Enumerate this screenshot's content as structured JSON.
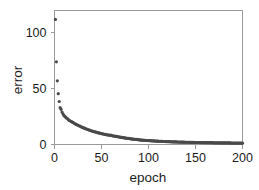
{
  "chart_data": {
    "type": "scatter",
    "title": "",
    "xlabel": "epoch",
    "ylabel": "error",
    "xlim": [
      0,
      200
    ],
    "ylim": [
      0,
      120
    ],
    "xticks": [
      0,
      50,
      100,
      150,
      200
    ],
    "yticks": [
      0,
      50,
      100
    ],
    "xtick_labels": [
      "0",
      "50",
      "100",
      "150",
      "200"
    ],
    "ytick_labels": [
      "0",
      "50",
      "100"
    ],
    "grid": false,
    "legend": null,
    "marker": {
      "shape": "circle",
      "color": "#4a4a4a",
      "size": 1.6
    },
    "frame_color": "#9a9a9a",
    "background": "#ffffff",
    "series": [
      {
        "name": "training error",
        "x": [
          1,
          2,
          3,
          4,
          5,
          6,
          7,
          8,
          9,
          10,
          11,
          12,
          13,
          14,
          15,
          16,
          17,
          18,
          19,
          20,
          21,
          22,
          23,
          24,
          25,
          26,
          27,
          28,
          29,
          30,
          31,
          32,
          33,
          34,
          35,
          36,
          37,
          38,
          39,
          40,
          41,
          42,
          43,
          44,
          45,
          46,
          47,
          48,
          49,
          50,
          51,
          52,
          53,
          54,
          55,
          56,
          57,
          58,
          59,
          60,
          61,
          62,
          63,
          64,
          65,
          66,
          67,
          68,
          69,
          70,
          71,
          72,
          73,
          74,
          75,
          76,
          77,
          78,
          79,
          80,
          81,
          82,
          83,
          84,
          85,
          86,
          87,
          88,
          89,
          90,
          91,
          92,
          93,
          94,
          95,
          96,
          97,
          98,
          99,
          100,
          101,
          102,
          103,
          104,
          105,
          106,
          107,
          108,
          109,
          110,
          111,
          112,
          113,
          114,
          115,
          116,
          117,
          118,
          119,
          120,
          121,
          122,
          123,
          124,
          125,
          126,
          127,
          128,
          129,
          130,
          131,
          132,
          133,
          134,
          135,
          136,
          137,
          138,
          139,
          140,
          141,
          142,
          143,
          144,
          145,
          146,
          147,
          148,
          149,
          150,
          151,
          152,
          153,
          154,
          155,
          156,
          157,
          158,
          159,
          160,
          161,
          162,
          163,
          164,
          165,
          166,
          167,
          168,
          169,
          170,
          171,
          172,
          173,
          174,
          175,
          176,
          177,
          178,
          179,
          180,
          181,
          182,
          183,
          184,
          185,
          186,
          187,
          188,
          189,
          190,
          191,
          192,
          193,
          194,
          195,
          196,
          197,
          198,
          199,
          200
        ],
        "y": [
          112.0,
          74.0,
          57.0,
          45.5,
          38.5,
          33.0,
          31.5,
          29.0,
          27.5,
          26.0,
          25.0,
          24.5,
          23.5,
          23.0,
          22.0,
          21.5,
          21.0,
          20.5,
          20.0,
          19.5,
          19.0,
          18.5,
          18.0,
          17.6,
          17.2,
          16.8,
          16.5,
          16.0,
          15.6,
          15.2,
          14.9,
          14.6,
          14.2,
          13.9,
          13.6,
          13.2,
          12.9,
          12.6,
          12.3,
          12.0,
          11.8,
          11.6,
          11.3,
          11.1,
          10.9,
          10.6,
          10.4,
          10.2,
          10.0,
          9.8,
          9.6,
          9.4,
          9.2,
          9.0,
          8.8,
          8.7,
          8.5,
          8.4,
          8.2,
          8.4,
          8.0,
          7.8,
          7.6,
          7.5,
          7.3,
          7.2,
          7.0,
          6.9,
          6.7,
          6.6,
          6.4,
          6.3,
          6.1,
          6.0,
          5.9,
          5.7,
          5.6,
          5.5,
          5.4,
          5.2,
          5.1,
          5.0,
          4.9,
          4.8,
          4.7,
          4.6,
          4.5,
          4.4,
          4.3,
          4.2,
          4.1,
          4.0,
          3.9,
          3.9,
          3.8,
          3.7,
          3.7,
          3.6,
          3.5,
          3.6,
          3.4,
          3.4,
          3.3,
          3.3,
          3.2,
          3.2,
          3.1,
          3.1,
          3.0,
          3.0,
          2.9,
          2.9,
          2.8,
          2.8,
          2.8,
          2.7,
          2.7,
          2.6,
          2.6,
          2.6,
          2.5,
          2.5,
          2.5,
          2.4,
          2.4,
          2.4,
          2.3,
          2.3,
          2.3,
          2.3,
          2.2,
          2.2,
          2.2,
          2.2,
          2.1,
          2.1,
          2.1,
          2.1,
          2.0,
          2.0,
          2.0,
          2.0,
          2.0,
          1.9,
          1.9,
          1.9,
          1.9,
          1.9,
          1.8,
          1.8,
          1.8,
          1.8,
          1.8,
          1.8,
          1.7,
          1.7,
          1.7,
          1.7,
          1.7,
          1.7,
          1.7,
          1.6,
          1.6,
          1.6,
          1.6,
          1.6,
          1.6,
          1.6,
          1.5,
          1.5,
          1.5,
          1.5,
          1.5,
          1.5,
          1.5,
          1.5,
          1.5,
          1.4,
          1.4,
          1.4,
          1.4,
          1.4,
          1.4,
          1.4,
          1.4,
          1.4,
          1.4,
          1.3,
          1.3,
          1.3,
          1.3,
          1.3,
          1.3,
          1.3,
          1.3,
          1.3,
          1.3,
          1.3,
          1.2,
          1.2
        ]
      }
    ]
  },
  "axes": {
    "x_title": "epoch",
    "y_title": "error"
  }
}
